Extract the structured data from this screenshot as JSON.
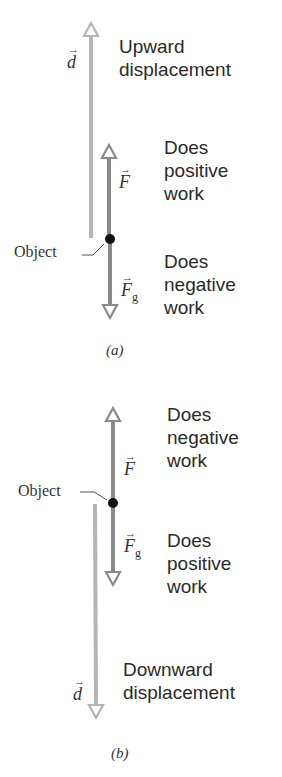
{
  "panels": [
    {
      "id": "a",
      "caption": "(a)",
      "displacement": {
        "symbol": "d",
        "label": "Upward\ndisplacement",
        "direction": "up"
      },
      "applied_force": {
        "symbol": "F",
        "label": "Does\npositive\nwork",
        "direction": "up"
      },
      "gravity_force": {
        "symbol": "F",
        "subscript": "g",
        "label": "Does\nnegative\nwork",
        "direction": "down"
      },
      "object_label": "Object"
    },
    {
      "id": "b",
      "caption": "(b)",
      "displacement": {
        "symbol": "d",
        "label": "Downward\ndisplacement",
        "direction": "down"
      },
      "applied_force": {
        "symbol": "F",
        "label": "Does\nnegative\nwork",
        "direction": "up"
      },
      "gravity_force": {
        "symbol": "F",
        "subscript": "g",
        "label": "Does\npositive\nwork",
        "direction": "down"
      },
      "object_label": "Object"
    }
  ],
  "colors": {
    "displacement_arrow": "#b5b5b5",
    "force_arrow": "#8a8a8a",
    "object_dot": "#111111",
    "text": "#2a2a2a"
  },
  "vector_arrow_glyph": "→"
}
